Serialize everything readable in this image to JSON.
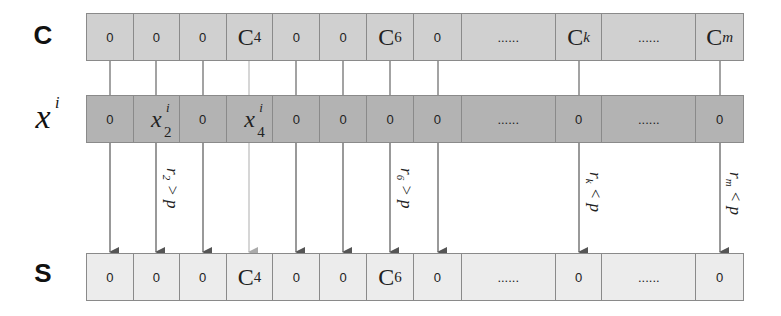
{
  "rows": {
    "c": {
      "label": "C",
      "cells": [
        "0",
        "0",
        "0",
        "C",
        "0",
        "0",
        "C",
        "0",
        "......",
        "C",
        "......",
        "C"
      ],
      "subs": [
        "",
        "",
        "",
        "4",
        "",
        "",
        "6",
        "",
        "",
        "k",
        "",
        "m"
      ]
    },
    "x": {
      "label": "x",
      "label_sup": "i",
      "cells": [
        "0",
        "x",
        "0",
        "x",
        "0",
        "0",
        "0",
        "0",
        "......",
        "0",
        "......",
        "0"
      ],
      "sups": [
        "",
        "i",
        "",
        "i",
        "",
        "",
        "",
        "",
        "",
        "",
        "",
        ""
      ],
      "subs": [
        "",
        "2",
        "",
        "4",
        "",
        "",
        "",
        "",
        "",
        "",
        "",
        ""
      ]
    },
    "s": {
      "label": "S",
      "cells": [
        "0",
        "0",
        "0",
        "C",
        "0",
        "0",
        "C",
        "0",
        "......",
        "0",
        "......",
        "0"
      ],
      "subs": [
        "",
        "",
        "",
        "4",
        "",
        "",
        "6",
        "",
        "",
        "",
        "",
        ""
      ]
    }
  },
  "conditions": [
    {
      "text": "r",
      "sub": "2",
      "rel": " > p"
    },
    {
      "text": "r",
      "sub": "6",
      "rel": " > p"
    },
    {
      "text": "r",
      "sub": "k",
      "rel": " < p"
    },
    {
      "text": "r",
      "sub": "m",
      "rel": " < p"
    }
  ],
  "colors": {
    "row_c": "#d0d0d0",
    "row_x": "#b3b3b3",
    "row_s": "#ececec",
    "arrow": "#555555",
    "arrow_light": "#aaaaaa"
  }
}
